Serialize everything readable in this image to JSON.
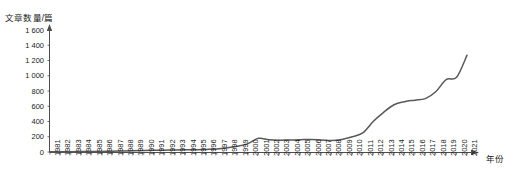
{
  "chart_data": {
    "type": "line",
    "title": "",
    "xlabel": "年份",
    "ylabel": "文章数量/篇",
    "ylim": [
      0,
      1600
    ],
    "y_ticks": [
      "0",
      "200",
      "400",
      "600",
      "800",
      "1 000",
      "1 200",
      "1 400",
      "1 600"
    ],
    "y_tick_values": [
      0,
      200,
      400,
      600,
      800,
      1000,
      1200,
      1400,
      1600
    ],
    "grid": false,
    "legend": "none",
    "line_color": "#595959",
    "categories": [
      "1981",
      "1982",
      "1983",
      "1984",
      "1985",
      "1986",
      "1987",
      "1988",
      "1989",
      "1990",
      "1991",
      "1992",
      "1993",
      "1994",
      "1995",
      "1996",
      "1997",
      "1998",
      "1999",
      "2000",
      "2001",
      "2002",
      "2003",
      "2004",
      "2005",
      "2006",
      "2007",
      "2008",
      "2009",
      "2010",
      "2011",
      "2012",
      "2013",
      "2014",
      "2015",
      "2016",
      "2017",
      "2018",
      "2019",
      "2020",
      "2021"
    ],
    "values": [
      2,
      3,
      4,
      5,
      6,
      8,
      10,
      14,
      18,
      20,
      22,
      24,
      26,
      28,
      30,
      34,
      40,
      55,
      75,
      110,
      180,
      160,
      155,
      158,
      160,
      165,
      158,
      150,
      165,
      200,
      250,
      400,
      520,
      620,
      660,
      680,
      700,
      790,
      950,
      980,
      1270
    ],
    "series_name": "文章数量"
  }
}
